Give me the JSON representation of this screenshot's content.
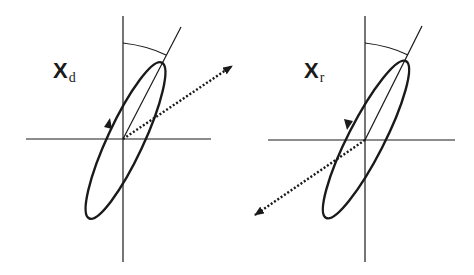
{
  "panels": [
    {
      "id": "left",
      "label_main": "X",
      "label_sub": "d",
      "rotation_direction": "counter-clockwise",
      "dotted_arrow_direction": "upper-right"
    },
    {
      "id": "right",
      "label_main": "X",
      "label_sub": "r",
      "rotation_direction": "clockwise",
      "dotted_arrow_direction": "lower-left"
    }
  ],
  "colors": {
    "stroke": "#1a1a1a",
    "background": "#ffffff"
  }
}
